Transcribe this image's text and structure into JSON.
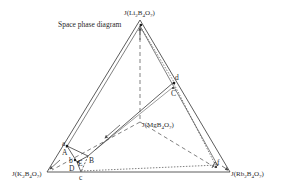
{
  "title": "Space phase diagram",
  "vertices": {
    "top": {
      "prefix": "J(Li",
      "sub1": "2",
      "mid": "B",
      "sub2": "4",
      "mid2": "O",
      "sub3": "7",
      "suffix": ")"
    },
    "left": {
      "prefix": "J(K",
      "sub1": "2",
      "mid": "B",
      "sub2": "4",
      "mid2": "O",
      "sub3": "7",
      "suffix": ")"
    },
    "right": {
      "prefix": "J(Rb",
      "sub1": "2",
      "mid": "B",
      "sub2": "4",
      "mid2": "O",
      "sub3": "7",
      "suffix": ")"
    },
    "center": {
      "prefix": "J(MgB",
      "sub1": "4",
      "mid": "O",
      "sub2": "7",
      "suffix": ")"
    }
  },
  "points": {
    "a": "a",
    "A": "A",
    "B": "B",
    "b": "b",
    "E": "E",
    "D": "D",
    "c": "c",
    "C": "C",
    "d": "d",
    "f": "f"
  },
  "colors": {
    "line": "#4a4a4a",
    "text": "#2a2a2a",
    "background": "#ffffff"
  }
}
